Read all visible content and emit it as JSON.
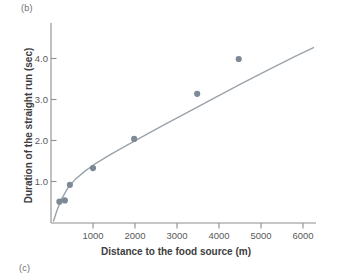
{
  "figure": {
    "panel_label_b": "(b)",
    "panel_label_c": "(c)"
  },
  "colors": {
    "marker": "#7d8a96",
    "curve": "#9aa3ab",
    "axis": "#8d8d8d",
    "text": "#3d3d3d",
    "tick_text": "#5a5a5a",
    "background": "#ffffff"
  },
  "chart_data": {
    "type": "scatter",
    "title": "",
    "xlabel": "Distance to the food source (m)",
    "ylabel": "Duration of the straight run (sec)",
    "xlim": [
      0,
      6500
    ],
    "ylim": [
      0,
      4.8
    ],
    "grid": false,
    "legend": "none",
    "xticks": [
      1000,
      2000,
      3000,
      4000,
      5000,
      6000
    ],
    "xtick_labels": [
      "1000",
      "2000",
      "3000",
      "4000",
      "5000",
      "6000"
    ],
    "yticks": [
      1.0,
      2.0,
      3.0,
      4.0
    ],
    "ytick_labels": [
      "1.0",
      "2.0",
      "3.0",
      "4.0"
    ],
    "series": [
      {
        "name": "Waggle dance straight-run duration",
        "marker": "filled-circle",
        "x": [
          200,
          330,
          450,
          1000,
          1980,
          3480,
          4470
        ],
        "y": [
          0.52,
          0.55,
          0.93,
          1.34,
          2.05,
          3.15,
          4.0
        ]
      }
    ],
    "fit_curve": {
      "name": "fitted curve",
      "style": "solid",
      "x": [
        60,
        150,
        260,
        400,
        580,
        800,
        1060,
        1380,
        1760,
        2200,
        2700,
        3250,
        3850,
        4500,
        5150,
        5800,
        6250
      ],
      "y": [
        0.05,
        0.33,
        0.6,
        0.85,
        1.07,
        1.26,
        1.45,
        1.65,
        1.87,
        2.12,
        2.4,
        2.7,
        3.03,
        3.38,
        3.72,
        4.06,
        4.28
      ]
    }
  }
}
